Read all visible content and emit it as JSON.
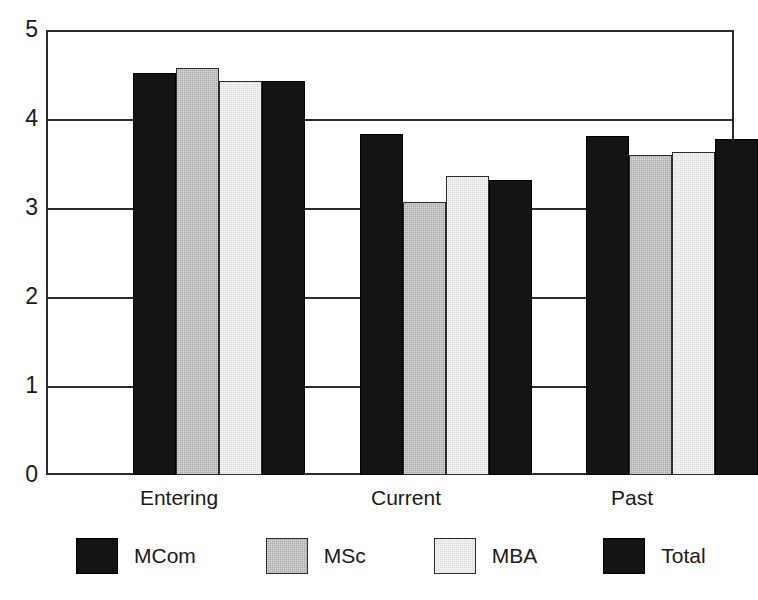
{
  "chart_data": {
    "type": "bar",
    "title": "",
    "subtitle": "",
    "xlabel": "",
    "ylabel": "",
    "categories": [
      "Entering",
      "Current",
      "Past"
    ],
    "series": [
      {
        "name": "MCom",
        "values": [
          4.52,
          3.83,
          3.81
        ],
        "color": "#141414",
        "fill": "solid-black"
      },
      {
        "name": "MSc",
        "values": [
          4.57,
          3.07,
          3.6
        ],
        "color": "#a9a9a9",
        "fill": "medium-gray-dither"
      },
      {
        "name": "MBA",
        "values": [
          4.43,
          3.36,
          3.63
        ],
        "color": "#dcdcdc",
        "fill": "light-gray-dither"
      },
      {
        "name": "Total",
        "values": [
          4.43,
          3.31,
          3.77
        ],
        "color": "#141414",
        "fill": "solid-black"
      }
    ],
    "ylim": [
      0,
      5
    ],
    "yticks": [
      0,
      1,
      2,
      3,
      4,
      5
    ],
    "ytick_labels": [
      "0",
      "1",
      "2",
      "3",
      "4",
      "5"
    ],
    "grid": true,
    "grid_axis": "y",
    "legend": true,
    "legend_position": "bottom"
  },
  "axes": {
    "y_tick_labels": [
      "5",
      "4",
      "3",
      "2",
      "1",
      "0"
    ]
  },
  "legend": {
    "items": [
      {
        "label": "MCom",
        "swatch": "swatch-dark"
      },
      {
        "label": "MSc",
        "swatch": "swatch-mid"
      },
      {
        "label": "MBA",
        "swatch": "swatch-light"
      },
      {
        "label": "Total",
        "swatch": "swatch-dark"
      }
    ]
  }
}
